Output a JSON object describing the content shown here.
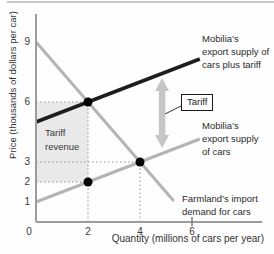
{
  "figure": {
    "curve_labels": {
      "supply_plus_tariff": [
        "Mobilia’s",
        "export supply of",
        "cars plus tariff"
      ],
      "supply": [
        "Mobilia’s",
        "export supply",
        "of cars"
      ],
      "demand": [
        "Farmland’s import",
        "demand for cars"
      ]
    },
    "region_label": [
      "Tariff",
      "revenue"
    ],
    "tariff_box_label": "Tariff"
  },
  "chart_data": {
    "type": "line",
    "title": "",
    "xlabel": "Quantity (millions of cars per year)",
    "ylabel": "Price (thousands of dollars per car)",
    "xlim": [
      0,
      8.7
    ],
    "ylim": [
      0,
      10.4
    ],
    "x_ticks": [
      0,
      2,
      4,
      6
    ],
    "y_ticks": [
      0,
      1,
      2,
      3,
      6,
      9
    ],
    "grid": false,
    "legend_position": "inline-labels",
    "series": [
      {
        "name": "Farmland’s import demand for cars",
        "role": "demand",
        "color": "#b4b4b4",
        "width": 3,
        "points": [
          [
            0,
            9
          ],
          [
            5.3,
            1.05
          ]
        ]
      },
      {
        "name": "Mobilia’s export supply of cars",
        "role": "supply",
        "color": "#b4b4b4",
        "width": 3,
        "points": [
          [
            0,
            1
          ],
          [
            6.3,
            4.15
          ]
        ]
      },
      {
        "name": "Mobilia’s export supply of cars plus tariff",
        "role": "supply-plus-tariff",
        "color": "#1d1d1d",
        "width": 3.5,
        "points": [
          [
            0,
            5
          ],
          [
            6.3,
            8.15
          ]
        ]
      }
    ],
    "markers": [
      {
        "x": 2,
        "y": 6
      },
      {
        "x": 4,
        "y": 3
      },
      {
        "x": 2,
        "y": 2
      }
    ],
    "guides": {
      "horizontal": [
        {
          "price": 6,
          "to_quantity": 2
        },
        {
          "price": 3,
          "to_quantity": 4
        },
        {
          "price": 2,
          "to_quantity": 2
        }
      ],
      "vertical": [
        {
          "quantity": 2,
          "to_price": 6
        },
        {
          "quantity": 4,
          "to_price": 3
        }
      ]
    },
    "shaded_region": {
      "label": "Tariff revenue",
      "quantity_range": [
        0,
        2
      ],
      "price_range": [
        2,
        6
      ],
      "fill": "#e9e9e9"
    },
    "tariff_arrow": {
      "quantity": 4.85,
      "price_from": 3.7,
      "price_to": 7.2,
      "color": "#c6c6c6"
    },
    "axis_color": "#9c9c9c",
    "guide_color": "#8f8f8f",
    "marker_color": "#000000"
  }
}
